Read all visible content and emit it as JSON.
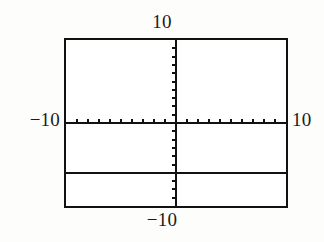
{
  "screen": {
    "name": "graphing-calculator-viewport",
    "background_color": "#fdfdfc",
    "frame_color": "#111111",
    "plot_color": "#111111"
  },
  "labels": {
    "ymax": "10",
    "ymin": "−10",
    "xmin": "−10",
    "xmax": "10"
  },
  "chart_data": {
    "type": "line",
    "title": "",
    "xlabel": "",
    "ylabel": "",
    "xlim": [
      -10,
      10
    ],
    "ylim": [
      -10,
      10
    ],
    "grid": false,
    "legend": "none",
    "axis_style": "crosshair-with-tick-marks",
    "xtick_interval": 1,
    "ytick_interval": 1,
    "xticks": [
      -9,
      -8,
      -7,
      -6,
      -5,
      -4,
      -3,
      -2,
      -1,
      1,
      2,
      3,
      4,
      5,
      6,
      7,
      8,
      9
    ],
    "yticks": [
      -9,
      -8,
      -7,
      -6,
      -5,
      -4,
      -3,
      -2,
      -1,
      1,
      2,
      3,
      4,
      5,
      6,
      7,
      8,
      9
    ],
    "xtick_labels": [
      "-10",
      "10"
    ],
    "ytick_labels": [
      "-10",
      "10"
    ],
    "corner_labels": {
      "top": "10",
      "bottom": "-10",
      "left": "-10",
      "right": "10"
    },
    "series": [
      {
        "name": "horizontal-line",
        "kind": "constant",
        "equation": "y = -6",
        "x": [
          -10,
          10
        ],
        "values": [
          -6,
          -6
        ]
      }
    ],
    "annotations": []
  }
}
